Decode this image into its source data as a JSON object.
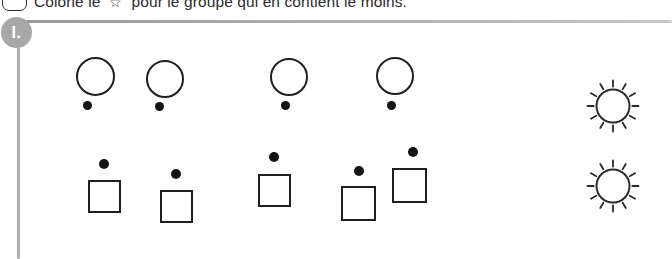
{
  "instruction": {
    "checkbox_name": "rounded-checkbox",
    "text_before_star": "Colorie le",
    "star_glyph": "☆",
    "text_after_star": "pour le groupe qui en contient le moins.",
    "full_text": "Colorie le ☆ pour le groupe qui en contient le moins."
  },
  "exercise": {
    "number_label": "I.",
    "badge_color": "#a8a8a8",
    "rule_color": "#b0b0b0"
  },
  "groups": [
    {
      "name": "circles-group",
      "shape": "circle",
      "count": 4,
      "outline_color": "#1f1f1f",
      "fill_color": "#ffffff",
      "dot_color": "#141414",
      "dot_position": "below",
      "items": [
        {
          "shape_x": 76,
          "shape_y": 57,
          "shape_size": 39,
          "dot_x": 83,
          "dot_y": 101,
          "dot_size": 9
        },
        {
          "shape_x": 146,
          "shape_y": 60,
          "shape_size": 38,
          "dot_x": 155,
          "dot_y": 102,
          "dot_size": 9
        },
        {
          "shape_x": 270,
          "shape_y": 58,
          "shape_size": 38,
          "dot_x": 281,
          "dot_y": 101,
          "dot_size": 9
        },
        {
          "shape_x": 376,
          "shape_y": 57,
          "shape_size": 38,
          "dot_x": 387,
          "dot_y": 101,
          "dot_size": 9
        }
      ]
    },
    {
      "name": "squares-group",
      "shape": "square",
      "count": 5,
      "outline_color": "#1f1f1f",
      "fill_color": "#ffffff",
      "dot_color": "#141414",
      "dot_position": "above",
      "items": [
        {
          "shape_x": 88,
          "shape_y": 180,
          "shape_size": 33,
          "dot_x": 99,
          "dot_y": 159,
          "dot_size": 10
        },
        {
          "shape_x": 160,
          "shape_y": 190,
          "shape_size": 33,
          "dot_x": 171,
          "dot_y": 169,
          "dot_size": 10
        },
        {
          "shape_x": 258,
          "shape_y": 174,
          "shape_size": 33,
          "dot_x": 269,
          "dot_y": 152,
          "dot_size": 10
        },
        {
          "shape_x": 341,
          "shape_y": 186,
          "shape_size": 35,
          "dot_x": 354,
          "dot_y": 166,
          "dot_size": 10
        },
        {
          "shape_x": 392,
          "shape_y": 168,
          "shape_size": 35,
          "dot_x": 408,
          "dot_y": 147,
          "dot_size": 10
        }
      ]
    }
  ],
  "answer_targets": [
    {
      "name": "star-target-circles",
      "x": 585,
      "y": 78,
      "size": 56,
      "for_group": "circles-group"
    },
    {
      "name": "star-target-squares",
      "x": 585,
      "y": 158,
      "size": 56,
      "for_group": "squares-group"
    }
  ],
  "colors": {
    "background": "#ffffff",
    "ink": "#1f1f1f",
    "gray_rule": "#b0b0b0",
    "badge_gray": "#a8a8a8"
  }
}
